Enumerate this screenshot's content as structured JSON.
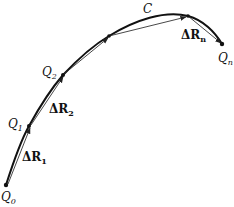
{
  "diagram": {
    "curve_label": "C",
    "points": [
      {
        "name": "Q",
        "sub": "0"
      },
      {
        "name": "Q",
        "sub": "1"
      },
      {
        "name": "Q",
        "sub": "2"
      },
      {
        "name": "Q",
        "sub": "n"
      }
    ],
    "vectors": [
      {
        "name": "ΔR",
        "sub": "1"
      },
      {
        "name": "ΔR",
        "sub": "2"
      },
      {
        "name": "ΔR",
        "sub": "n"
      }
    ],
    "colors": {
      "curve": "#111111",
      "vector": "#333333"
    }
  }
}
